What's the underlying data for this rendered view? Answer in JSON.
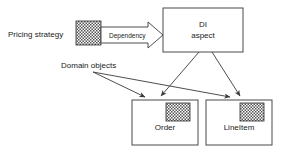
{
  "diagram": {
    "background_color": "#ffffff",
    "line_color": "#3a3a3a",
    "box_stroke_color": "#4a4a4a",
    "text_color": "#1a1a1a"
  },
  "labels": {
    "pricing_strategy": "Pricing strategy",
    "domain_objects": "Domain objects",
    "dependency": "Dependency"
  },
  "boxes": [
    {
      "id": "di-aspect",
      "line1": "DI",
      "line2": "aspect",
      "x": 163,
      "y": 8,
      "width": 80,
      "height": 44,
      "has_icon": false
    },
    {
      "id": "order",
      "line1": "Order",
      "line2": "",
      "x": 132,
      "y": 100,
      "width": 66,
      "height": 45,
      "has_icon": true
    },
    {
      "id": "lineitem",
      "line1": "LineItem",
      "line2": "",
      "x": 206,
      "y": 100,
      "width": 66,
      "height": 45,
      "has_icon": true
    }
  ],
  "icons": [
    {
      "id": "pricing-strategy-aspect-icon",
      "name": "checkered-aspect-icon",
      "x": 76,
      "y": 21,
      "width": 25,
      "height": 24
    },
    {
      "id": "order-aspect-icon",
      "name": "checkered-aspect-icon",
      "x": 166,
      "y": 103,
      "width": 24,
      "height": 18
    },
    {
      "id": "lineitem-aspect-icon",
      "name": "checkered-aspect-icon",
      "x": 240,
      "y": 103,
      "width": 24,
      "height": 18
    }
  ],
  "connectors": [
    {
      "id": "dependency-block-arrow",
      "from": "pricing-strategy-aspect-icon",
      "to": "di-aspect",
      "style": "hollow-block-arrow"
    },
    {
      "id": "di-to-order",
      "from": "di-aspect",
      "to": "order",
      "style": "line-arrow"
    },
    {
      "id": "di-to-lineitem",
      "from": "di-aspect",
      "to": "lineitem",
      "style": "line-arrow"
    },
    {
      "id": "domain-objects-to-order",
      "from": "domain-objects-label",
      "to": "order-aspect-icon",
      "style": "line-arrow"
    },
    {
      "id": "domain-objects-to-lineitem",
      "from": "domain-objects-label",
      "to": "lineitem-aspect-icon",
      "style": "line-arrow"
    }
  ]
}
